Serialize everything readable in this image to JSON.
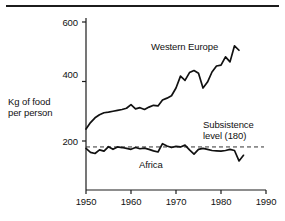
{
  "figure": {
    "name": "food-production-per-person-chart",
    "top_rule": true,
    "background_color": "#ffffff",
    "line_color": "#111111"
  },
  "axes": {
    "y_title_line1": "Kg of food",
    "y_title_line2": "per person",
    "y_ticks": [
      "600",
      "400",
      "200"
    ],
    "y_tick_values": [
      600,
      400,
      200
    ],
    "x_ticks": [
      "1950",
      "1960",
      "1970",
      "1980",
      "1990"
    ],
    "x_tick_values": [
      1950,
      1960,
      1970,
      1980,
      1990
    ],
    "ylim": [
      0,
      600
    ],
    "xlim": [
      1950,
      1990
    ],
    "grid": false
  },
  "annotations": {
    "western_europe_label": "Western Europe",
    "africa_label": "Africa",
    "subsistence_line1": "Subsistence",
    "subsistence_line2": "level (180)"
  },
  "chart_data": {
    "type": "line",
    "title": "",
    "subtitle": "",
    "xlabel": "",
    "ylabel": "Kg of food per person",
    "xlim": [
      1950,
      1990
    ],
    "ylim": [
      0,
      600
    ],
    "grid": false,
    "legend_position": "inline-annotations",
    "x": [
      1950,
      1951,
      1952,
      1953,
      1954,
      1955,
      1956,
      1957,
      1958,
      1959,
      1960,
      1961,
      1962,
      1963,
      1964,
      1965,
      1966,
      1967,
      1968,
      1969,
      1970,
      1971,
      1972,
      1973,
      1974,
      1975,
      1976,
      1977,
      1978,
      1979,
      1980,
      1981,
      1982,
      1983,
      1984,
      1985
    ],
    "series": [
      {
        "name": "Western Europe",
        "color": "#111111",
        "values": [
          240,
          262,
          278,
          288,
          295,
          297,
          300,
          303,
          306,
          310,
          322,
          308,
          312,
          306,
          314,
          320,
          318,
          338,
          344,
          352,
          378,
          418,
          404,
          430,
          437,
          428,
          378,
          398,
          432,
          452,
          455,
          483,
          466,
          520,
          505,
          null
        ]
      },
      {
        "name": "Africa",
        "color": "#111111",
        "values": [
          175,
          162,
          158,
          170,
          166,
          181,
          172,
          180,
          178,
          175,
          172,
          178,
          174,
          176,
          172,
          167,
          163,
          191,
          183,
          178,
          182,
          180,
          186,
          170,
          156,
          172,
          175,
          172,
          168,
          167,
          166,
          168,
          172,
          168,
          133,
          152
        ]
      }
    ],
    "reference_lines": [
      {
        "name": "Subsistence level",
        "value": 180,
        "style": "dashed",
        "label": "Subsistence level (180)"
      }
    ]
  }
}
